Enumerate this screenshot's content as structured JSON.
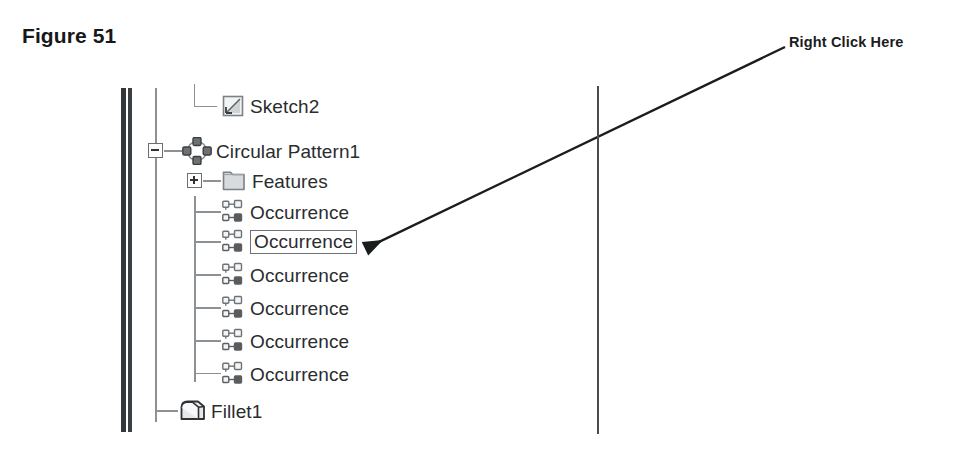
{
  "figure": {
    "caption": "Figure 51"
  },
  "annotation": {
    "label": "Right Click Here",
    "arrow_from": [
      785,
      47
    ],
    "arrow_to": [
      383,
      240
    ],
    "color": "#1a1c1e"
  },
  "feature_tree": {
    "panel_border_color": "#35383a",
    "tree_line_color": "#8d9194",
    "text_color": "#2a2c2e",
    "selection_border_color": "#6d7175",
    "rows": [
      {
        "label": "Sketch2",
        "icon": "sketch-icon",
        "depth": 2,
        "toggle": "none",
        "selected": false,
        "connector": "elbow-last"
      },
      {
        "label": "Circular Pattern1",
        "icon": "circular-pattern-icon",
        "depth": 1,
        "toggle": "minus",
        "selected": false,
        "connector": "stub"
      },
      {
        "label": "Features",
        "icon": "folder-icon",
        "depth": 2,
        "toggle": "plus",
        "selected": false,
        "connector": "stub"
      },
      {
        "label": "Occurrence",
        "icon": "occurrence-icon",
        "depth": 3,
        "toggle": "none",
        "selected": false,
        "connector": "stub"
      },
      {
        "label": "Occurrence",
        "icon": "occurrence-icon",
        "depth": 3,
        "toggle": "none",
        "selected": true,
        "connector": "stub"
      },
      {
        "label": "Occurrence",
        "icon": "occurrence-icon",
        "depth": 3,
        "toggle": "none",
        "selected": false,
        "connector": "stub"
      },
      {
        "label": "Occurrence",
        "icon": "occurrence-icon",
        "depth": 3,
        "toggle": "none",
        "selected": false,
        "connector": "stub"
      },
      {
        "label": "Occurrence",
        "icon": "occurrence-icon",
        "depth": 3,
        "toggle": "none",
        "selected": false,
        "connector": "stub"
      },
      {
        "label": "Occurrence",
        "icon": "occurrence-icon",
        "depth": 3,
        "toggle": "none",
        "selected": false,
        "connector": "elbow-last"
      },
      {
        "label": "Fillet1",
        "icon": "fillet-icon",
        "depth": 1,
        "toggle": "none",
        "selected": false,
        "connector": "stub"
      }
    ]
  }
}
